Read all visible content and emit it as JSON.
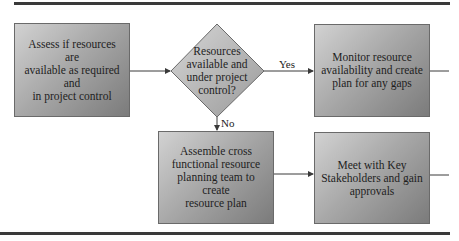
{
  "diagram": {
    "type": "flowchart",
    "nodes": [
      {
        "id": "assess",
        "shape": "rectangle",
        "lines": [
          "Assess if resources are",
          "available as required and",
          "in project control"
        ]
      },
      {
        "id": "decision",
        "shape": "diamond",
        "lines": [
          "Resources",
          "available and",
          "under project",
          "control?"
        ]
      },
      {
        "id": "monitor",
        "shape": "rectangle",
        "lines": [
          "Monitor resource",
          "availability and create",
          "plan for any gaps"
        ]
      },
      {
        "id": "assemble",
        "shape": "rectangle",
        "lines": [
          "Assemble cross",
          "functional resource",
          "planning team to create",
          "resource plan"
        ]
      },
      {
        "id": "meet",
        "shape": "rectangle",
        "lines": [
          "Meet with Key",
          "Stakeholders and gain",
          "approvals"
        ]
      }
    ],
    "edges": [
      {
        "from": "assess",
        "to": "decision",
        "label": ""
      },
      {
        "from": "decision",
        "to": "monitor",
        "label": "Yes"
      },
      {
        "from": "decision",
        "to": "assemble",
        "label": "No"
      },
      {
        "from": "assemble",
        "to": "meet",
        "label": ""
      }
    ],
    "yes_label": "Yes",
    "no_label": "No"
  },
  "colors": {
    "box_light": "#d2d2d2",
    "box_dark": "#7b7b7b",
    "diamond_fill": "#b4b4b4",
    "line": "#3a3a3a"
  }
}
